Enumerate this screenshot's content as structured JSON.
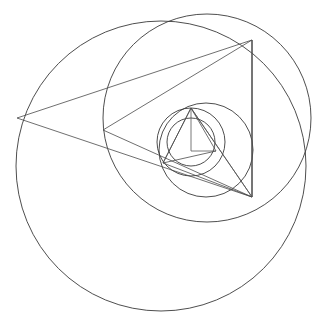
{
  "figure": {
    "type": "geometric-construction",
    "width": 318,
    "height": 332,
    "background_color": "#ffffff",
    "stroke_color": "#3a3a3a",
    "triangle_stroke_color": "#4a4a4a",
    "spoke_stroke_color": "#555555",
    "stroke_width": 0.9,
    "iterations": 5,
    "circles": [
      {
        "name": "circle-1",
        "cx": 161,
        "cy": 166,
        "r": 145
      },
      {
        "name": "circle-2",
        "cx": 207,
        "cy": 118,
        "r": 104
      },
      {
        "name": "circle-3",
        "cx": 206,
        "cy": 150,
        "r": 47
      },
      {
        "name": "circle-4",
        "cx": 191,
        "cy": 142,
        "r": 34
      },
      {
        "name": "circle-5",
        "cx": 191,
        "cy": 142,
        "r": 24
      }
    ],
    "triangles": [
      {
        "name": "triangle-1",
        "points": "17,118 252,40 252,197",
        "vertices": [
          {
            "x": 17,
            "y": 118
          },
          {
            "x": 252,
            "y": 40
          },
          {
            "x": 252,
            "y": 197
          }
        ]
      },
      {
        "name": "triangle-2",
        "points": "103,130 252,40 252,197",
        "vertices": [
          {
            "x": 103,
            "y": 130
          },
          {
            "x": 252,
            "y": 40
          },
          {
            "x": 252,
            "y": 197
          }
        ]
      },
      {
        "name": "triangle-3",
        "points": "163,163 191,108 252,197",
        "vertices": [
          {
            "x": 163,
            "y": 163
          },
          {
            "x": 191,
            "y": 108
          },
          {
            "x": 252,
            "y": 197
          }
        ]
      },
      {
        "name": "triangle-4",
        "points": "163,163 191,108 216,151",
        "vertices": [
          {
            "x": 163,
            "y": 163
          },
          {
            "x": 191,
            "y": 108
          },
          {
            "x": 216,
            "y": 151
          }
        ]
      }
    ],
    "spokes": [
      {
        "name": "spoke-1",
        "x1": 252,
        "y1": 40,
        "x2": 252,
        "y2": 197
      },
      {
        "name": "spoke-2",
        "x1": 191,
        "y1": 108,
        "x2": 191,
        "y2": 151
      },
      {
        "name": "spoke-3",
        "x1": 191,
        "y1": 151,
        "x2": 216,
        "y2": 151
      },
      {
        "name": "spoke-4",
        "x1": 191,
        "y1": 108,
        "x2": 252,
        "y2": 197
      }
    ]
  }
}
